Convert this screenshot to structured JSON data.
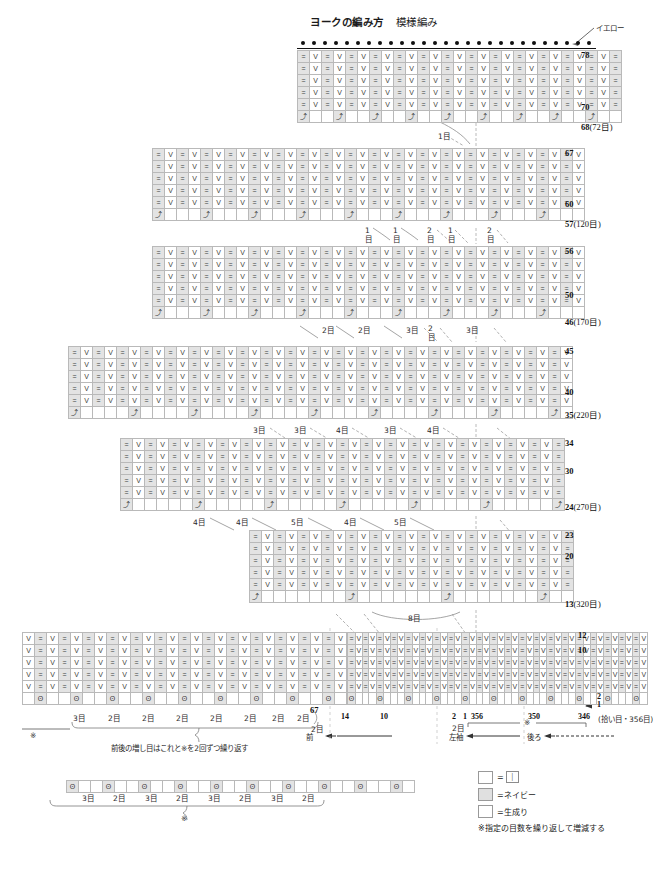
{
  "title": {
    "main": "ヨークの編み方",
    "sub": "模様編み"
  },
  "yarn_callout": {
    "label": "イエロー"
  },
  "legend": {
    "items": [
      {
        "swatch": "plain",
        "label": "=",
        "symbol": "|"
      },
      {
        "swatch": "navy",
        "label": "=ネイビー",
        "symbol": ""
      },
      {
        "swatch": "plain",
        "label": "=生成り",
        "symbol": ""
      }
    ],
    "footnote": "※指定の目数を繰り返して増減する"
  },
  "blocks": [
    {
      "id": "block-1",
      "cols": 27,
      "rows": 5,
      "has_castoff_row": true,
      "has_dot_row": true,
      "row_labels": [
        {
          "text": "78",
          "paren": ""
        },
        {
          "text": "70",
          "paren": ""
        },
        {
          "text": "68",
          "paren": "(72目)"
        }
      ],
      "decrease_notes": [
        "1目"
      ]
    },
    {
      "id": "block-2",
      "cols": 36,
      "rows": 5,
      "has_castoff_row": true,
      "has_dot_row": false,
      "row_labels": [
        {
          "text": "67",
          "paren": ""
        },
        {
          "text": "60",
          "paren": ""
        },
        {
          "text": "57",
          "paren": "(120目)"
        }
      ],
      "decrease_notes": [
        "1目",
        "1目",
        "2目",
        "1目",
        "2目"
      ]
    },
    {
      "id": "block-3",
      "cols": 36,
      "rows": 5,
      "has_castoff_row": true,
      "has_dot_row": false,
      "row_labels": [
        {
          "text": "56",
          "paren": ""
        },
        {
          "text": "50",
          "paren": ""
        },
        {
          "text": "46",
          "paren": "(170目)"
        }
      ],
      "decrease_notes": [
        "2目",
        "2目",
        "3目",
        "2目",
        "3目"
      ]
    },
    {
      "id": "block-4",
      "cols": 42,
      "rows": 5,
      "has_castoff_row": true,
      "has_dot_row": false,
      "row_labels": [
        {
          "text": "45",
          "paren": ""
        },
        {
          "text": "40",
          "paren": ""
        },
        {
          "text": "35",
          "paren": "(220目)"
        }
      ],
      "decrease_notes": [
        "3目",
        "3目",
        "4目",
        "3目",
        "4目"
      ]
    },
    {
      "id": "block-5",
      "cols": 37,
      "rows": 5,
      "has_castoff_row": true,
      "has_dot_row": false,
      "row_labels": [
        {
          "text": "34",
          "paren": ""
        },
        {
          "text": "30",
          "paren": ""
        },
        {
          "text": "24",
          "paren": "(270目)"
        }
      ],
      "decrease_notes": [
        "4目",
        "4目",
        "5目",
        "4目",
        "5目"
      ]
    },
    {
      "id": "block-6",
      "cols": 27,
      "rows": 5,
      "has_castoff_row": true,
      "has_dot_row": false,
      "row_labels": [
        {
          "text": "23",
          "paren": ""
        },
        {
          "text": "20",
          "paren": ""
        },
        {
          "text": "13",
          "paren": "(320目)"
        }
      ],
      "decrease_notes": [
        "8目"
      ]
    },
    {
      "id": "block-7",
      "cols": 43,
      "rows": 5,
      "has_castoff_row": true,
      "has_dot_row": false,
      "row_labels": [
        {
          "text": "12",
          "paren": ""
        },
        {
          "text": "10",
          "paren": ""
        }
      ],
      "arrows": [
        "2",
        "1"
      ],
      "stitch_numbers": [
        "14",
        "10",
        "2",
        "1",
        "356",
        "350",
        "346"
      ],
      "pickup_note": "(拾い目・356目)",
      "body_notes": [
        "2目"
      ],
      "section_labels": [
        "左袖",
        "後ろ"
      ],
      "repeat_marker": "※"
    },
    {
      "id": "block-front",
      "cols": 27,
      "rows": 5,
      "has_castoff_row": true,
      "has_dot_row": false,
      "row_labels": [
        {
          "text": "67",
          "paren": ""
        }
      ],
      "increase_notes": [
        "3目",
        "2目",
        "2目",
        "2目",
        "2目",
        "2目",
        "2目",
        "2目"
      ],
      "tail_note": "2目",
      "repeat_marker": "※",
      "instruction": "前後の増し目はこれと※を2回ずつ繰り返す",
      "section_label": "前"
    },
    {
      "id": "block-repeat",
      "cols": 29,
      "rows": 1,
      "increase_notes": [
        "3目",
        "2目",
        "3目",
        "2目",
        "3目",
        "2目",
        "3目",
        "2目"
      ],
      "repeat_marker": "※"
    }
  ],
  "symbols": {
    "purl": "=",
    "knit_v": "V",
    "decrease": "⤴",
    "increase": "ʘ"
  }
}
